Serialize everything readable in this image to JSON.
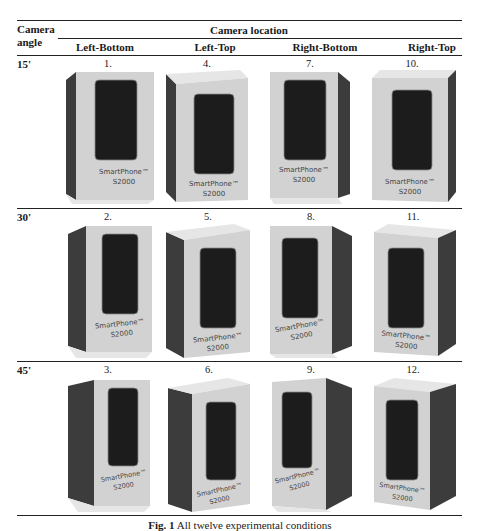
{
  "table": {
    "row_header": "Camera angle",
    "row_header_lines": [
      "Camera",
      "angle"
    ],
    "group_header": "Camera location",
    "columns": [
      "Left-Bottom",
      "Left-Top",
      "Right-Bottom",
      "Right-Top"
    ],
    "rows": [
      {
        "angle": "15'",
        "cells": [
          {
            "num": "1.",
            "label": "SmartPhone™",
            "model": "S2000",
            "view": "left-bottom"
          },
          {
            "num": "4.",
            "label": "SmartPhone™",
            "model": "S2000",
            "view": "left-top"
          },
          {
            "num": "7.",
            "label": "SmartPhone™",
            "model": "S2000",
            "view": "right-bottom"
          },
          {
            "num": "10.",
            "label": "SmartPhone™",
            "model": "S2000",
            "view": "right-top"
          }
        ]
      },
      {
        "angle": "30'",
        "cells": [
          {
            "num": "2.",
            "label": "SmartPhone™",
            "model": "S2000",
            "view": "left-bottom"
          },
          {
            "num": "5.",
            "label": "SmartPhone™",
            "model": "S2000",
            "view": "left-top"
          },
          {
            "num": "8.",
            "label": "SmartPhone™",
            "model": "S2000",
            "view": "right-bottom"
          },
          {
            "num": "11.",
            "label": "SmartPhone™",
            "model": "S2000",
            "view": "right-top"
          }
        ]
      },
      {
        "angle": "45'",
        "cells": [
          {
            "num": "3.",
            "label": "SmartPhone™",
            "model": "S2000",
            "view": "left-bottom"
          },
          {
            "num": "6.",
            "label": "SmartPhone™",
            "model": "S2000",
            "view": "left-top"
          },
          {
            "num": "9.",
            "label": "SmartPhone™",
            "model": "S2000",
            "view": "right-bottom"
          },
          {
            "num": "12.",
            "label": "SmartPhone™",
            "model": "S2000",
            "view": "right-top"
          }
        ]
      }
    ]
  },
  "caption": {
    "label": "Fig. 1",
    "text": "All twelve experimental conditions"
  },
  "colors": {
    "box_face": "#d2d2d2",
    "box_side": "#3c3c3c",
    "box_top": "#e4e4e4",
    "screen": "#1c1c1c",
    "rule": "#222222"
  }
}
